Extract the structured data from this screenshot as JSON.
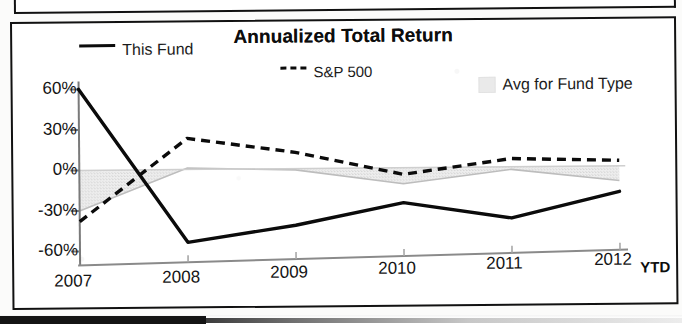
{
  "chart_data": {
    "type": "line",
    "title": "Annualized Total Return",
    "xlabel": "",
    "ylabel": "",
    "categories": [
      "2007",
      "2008",
      "2009",
      "2010",
      "2011",
      "2012"
    ],
    "x_axis_suffix": "YTD",
    "ytick_labels": [
      "60%",
      "30%",
      "0%",
      "-30%",
      "-60%"
    ],
    "ytick_values": [
      60,
      30,
      0,
      -30,
      -60
    ],
    "ylim": [
      -60,
      60
    ],
    "grid": false,
    "legend_position": "top",
    "series": [
      {
        "name": "This Fund",
        "style": "solid",
        "color": "#0b0b0b",
        "values": [
          60,
          -54,
          -42,
          -26,
          -38,
          -19
        ]
      },
      {
        "name": "S&P 500",
        "style": "dashed",
        "color": "#0b0b0b",
        "values": [
          -38,
          23,
          12,
          -5,
          6,
          4
        ]
      },
      {
        "name": "Avg for Fund Type",
        "style": "area",
        "color": "#e6e6e6",
        "values": [
          -30,
          1,
          -1,
          -12,
          -2,
          -11
        ]
      }
    ]
  },
  "legend": {
    "items": [
      {
        "label": "This Fund",
        "marker": "solid-line-swatch"
      },
      {
        "label": "S&P 500",
        "marker": "dashed-line-swatch"
      },
      {
        "label": "Avg for Fund Type",
        "marker": "gray-area-swatch"
      }
    ]
  },
  "axis": {
    "y_ticks": [
      "60%",
      "30%",
      "0%",
      "-30%",
      "-60%"
    ],
    "x_ticks": [
      "2007",
      "2008",
      "2009",
      "2010",
      "2011",
      "2012"
    ],
    "x_suffix": "YTD"
  },
  "colors": {
    "line": "#0b0b0b",
    "area_fill": "#e6e6e6",
    "axis": "#6f6f6f",
    "frame": "#111111",
    "background": "#ffffff"
  }
}
